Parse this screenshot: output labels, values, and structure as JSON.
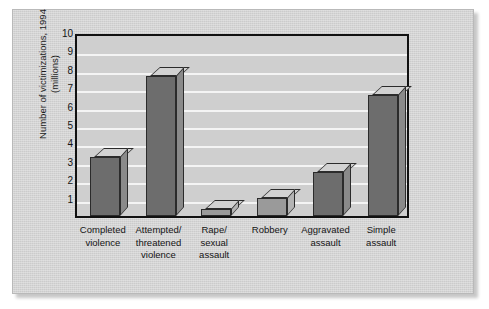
{
  "chart_data": {
    "type": "bar",
    "title": "",
    "subtitle": "",
    "xlabel": "",
    "ylabel": "Number of victimizations, 1994\n(millions)",
    "ylim": [
      0,
      10
    ],
    "yticks": [
      10,
      9,
      8,
      7,
      6,
      5,
      4,
      3,
      2,
      1
    ],
    "grid": "horizontal",
    "legend": "none",
    "style": "3d-bars",
    "categories": [
      "Completed\nviolence",
      "Attempted/\nthreatened\nviolence",
      "Rape/\nsexual\nassault",
      "Robbery",
      "Aggravated\nassault",
      "Simple\nassault"
    ],
    "values": [
      3.2,
      7.6,
      0.4,
      1.0,
      2.4,
      6.6
    ],
    "series": [
      {
        "name": "Number of victimizations, 1994 (millions)",
        "values": [
          3.2,
          7.6,
          0.4,
          1.0,
          2.4,
          6.6
        ]
      }
    ],
    "bar_shading": [
      "dark",
      "dark",
      "light",
      "light",
      "dark",
      "dark"
    ],
    "colors": {
      "bar_front_dark": "#6d6d6d",
      "bar_front_light": "#9a9a9a",
      "bar_top": "#d2d2d2",
      "bar_side_dark": "#8a8a8a",
      "bar_side_light": "#b4b4b4",
      "plot_background": "#cfcfcf",
      "panel_background": "#d3d3d3",
      "gridline": "#f4f4f4",
      "axis": "#111111",
      "text": "#141414"
    }
  }
}
